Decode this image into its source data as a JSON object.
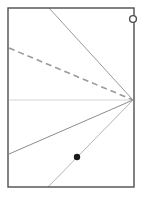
{
  "figure": {
    "title": "",
    "background_color": "#ffffff",
    "width": 144,
    "height": 201
  },
  "frame": {
    "name": "rectangle-border",
    "x": 8,
    "y": 8,
    "width": 126,
    "height": 179,
    "stroke_color": "#4d4d4d",
    "stroke_width": 1.4,
    "fill": "none"
  },
  "vertex": {
    "name": "convergence-point",
    "x": 133,
    "y": 100
  },
  "rays": [
    {
      "id": "ray-top-steep",
      "label": "ray to top edge",
      "x1": 49,
      "y1": 8,
      "x2": 133,
      "y2": 100,
      "stroke_color": "#9a9a9a",
      "stroke_width": 1.0,
      "dash": "none"
    },
    {
      "id": "ray-dashed-upper-left",
      "label": "dashed ray to left edge",
      "x1": 9,
      "y1": 48,
      "x2": 133,
      "y2": 100,
      "stroke_color": "#9a9a9a",
      "stroke_width": 1.6,
      "dash": "6 4"
    },
    {
      "id": "ray-horizontal",
      "label": "horizontal ray to left edge",
      "x1": 9,
      "y1": 100,
      "x2": 133,
      "y2": 100,
      "stroke_color": "#d4d4d4",
      "stroke_width": 1.0,
      "dash": "none"
    },
    {
      "id": "ray-lower-left",
      "label": "ray to lower left edge",
      "x1": 9,
      "y1": 154,
      "x2": 133,
      "y2": 100,
      "stroke_color": "#8c8c8c",
      "stroke_width": 1.0,
      "dash": "none"
    },
    {
      "id": "ray-bottom-steep",
      "label": "ray to bottom edge through marker",
      "x1": 48,
      "y1": 187,
      "x2": 133,
      "y2": 100,
      "stroke_color": "#b5b5b5",
      "stroke_width": 1.0,
      "dash": "none"
    }
  ],
  "markers": [
    {
      "id": "filled-dot",
      "name": "point-marker-filled",
      "x": 77,
      "y": 157,
      "radius": 3.2,
      "fill_color": "#1a1a1a",
      "stroke_color": "#1a1a1a",
      "label": ""
    },
    {
      "id": "open-circle",
      "name": "point-marker-open",
      "x": 133,
      "y": 19,
      "radius": 3.4,
      "fill_color": "#ffffff",
      "stroke_color": "#4d4d4d",
      "stroke_width": 1.4,
      "label": ""
    }
  ],
  "labels": []
}
